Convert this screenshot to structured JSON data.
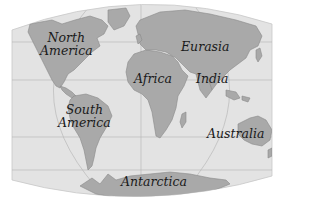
{
  "map": {
    "projection": "world outline (elliptical / interrupted-style)",
    "colors": {
      "ocean": "#e3e3e3",
      "land": "#a9a9a9",
      "land_edge": "#8a8a8a",
      "grid": "#b9b9b9",
      "label": "#1a1a1a",
      "background": "#ffffff"
    },
    "labels": {
      "north_america_line1": "North",
      "north_america_line2": "America",
      "eurasia": "Eurasia",
      "africa": "Africa",
      "india": "India",
      "south_america_line1": "South",
      "south_america_line2": "America",
      "australia": "Australia",
      "antarctica": "Antarctica"
    }
  }
}
